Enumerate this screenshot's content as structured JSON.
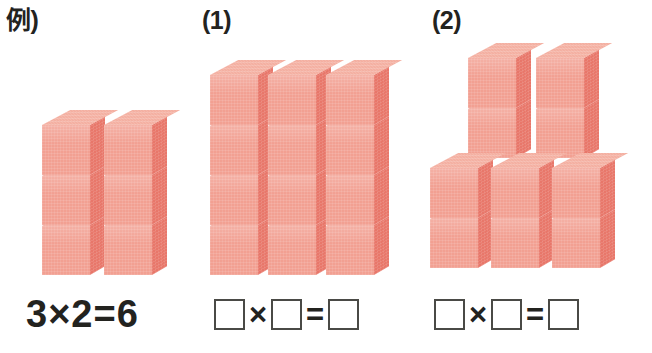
{
  "page": {
    "background_color": "#ffffff"
  },
  "colors": {
    "cube_front": "#f2a092",
    "cube_side": "#e8776a",
    "cube_top": "#f4b0a2",
    "text": "#23231f",
    "box_border": "#4a4a46"
  },
  "problems": [
    {
      "label": "例)",
      "kind": "example",
      "groups": [
        {
          "stacks": 2,
          "height": 3
        }
      ],
      "equation": {
        "type": "filled",
        "text": "3×2=6",
        "multiplicand": "3",
        "multiplier": "2",
        "product": "6",
        "times_symbol": "×",
        "equals_symbol": "="
      }
    },
    {
      "label": "(1)",
      "kind": "question",
      "groups": [
        {
          "stacks": 3,
          "height": 4
        }
      ],
      "equation": {
        "type": "blank",
        "multiplicand": "",
        "multiplier": "",
        "product": "",
        "times_symbol": "×",
        "equals_symbol": "="
      }
    },
    {
      "label": "(2)",
      "kind": "question",
      "groups": [
        {
          "stacks": 2,
          "height": 2
        },
        {
          "stacks": 3,
          "height": 2
        }
      ],
      "equation": {
        "type": "blank",
        "multiplicand": "",
        "multiplier": "",
        "product": "",
        "times_symbol": "×",
        "equals_symbol": "="
      }
    }
  ]
}
